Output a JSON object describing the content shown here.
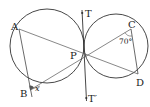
{
  "diagram": {
    "points": {
      "A": "A",
      "B": "B",
      "C": "C",
      "D": "D",
      "P": "P",
      "T": "T",
      "T_prime": "T′"
    },
    "angles": {
      "angle_C": "70°",
      "angle_B": "x"
    },
    "colors": {
      "stroke": "#333333",
      "background": "#ffffff",
      "angle_fill": "#555555"
    }
  }
}
